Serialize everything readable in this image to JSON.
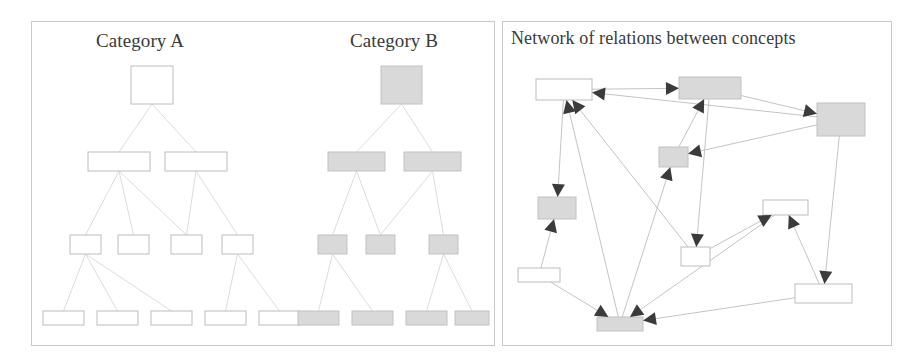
{
  "figure": {
    "background": "#ffffff",
    "panel_border_color": "#c9c9c9",
    "node_white_fill": "#ffffff",
    "node_gray_fill": "#d9d9d9",
    "node_stroke_color": "#bdbdbd",
    "edge_color": "#dcdcdc",
    "arrow_color": "#3b3b3b"
  },
  "panels": {
    "left": {
      "name": "hierarchies-panel",
      "x": 31,
      "y": 21,
      "width": 464,
      "height": 325
    },
    "right": {
      "name": "network-panel",
      "x": 502,
      "y": 21,
      "width": 390,
      "height": 325
    }
  },
  "titles": {
    "category_a": "Category A",
    "category_b": "Category B",
    "network": "Network of relations between concepts"
  },
  "tree_a": {
    "label": "Category A",
    "fill": "white",
    "nodes": [
      {
        "id": "a0",
        "level": 0,
        "x": 131,
        "y": 66,
        "w": 42,
        "h": 38
      },
      {
        "id": "a1",
        "level": 1,
        "x": 88,
        "y": 152,
        "w": 62,
        "h": 19
      },
      {
        "id": "a2",
        "level": 1,
        "x": 165,
        "y": 152,
        "w": 62,
        "h": 19
      },
      {
        "id": "a3",
        "level": 2,
        "x": 70,
        "y": 235,
        "w": 31,
        "h": 19
      },
      {
        "id": "a4",
        "level": 2,
        "x": 118,
        "y": 235,
        "w": 31,
        "h": 19
      },
      {
        "id": "a5",
        "level": 2,
        "x": 171,
        "y": 235,
        "w": 31,
        "h": 19
      },
      {
        "id": "a6",
        "level": 2,
        "x": 222,
        "y": 235,
        "w": 31,
        "h": 19
      },
      {
        "id": "a7",
        "level": 3,
        "x": 43,
        "y": 311,
        "w": 41,
        "h": 14
      },
      {
        "id": "a8",
        "level": 3,
        "x": 97,
        "y": 311,
        "w": 41,
        "h": 14
      },
      {
        "id": "a9",
        "level": 3,
        "x": 151,
        "y": 311,
        "w": 41,
        "h": 14
      },
      {
        "id": "a10",
        "level": 3,
        "x": 205,
        "y": 311,
        "w": 41,
        "h": 14
      },
      {
        "id": "a11",
        "level": 3,
        "x": 259,
        "y": 311,
        "w": 41,
        "h": 14
      }
    ],
    "edges": [
      [
        "a0",
        "a1"
      ],
      [
        "a0",
        "a2"
      ],
      [
        "a1",
        "a3"
      ],
      [
        "a1",
        "a4"
      ],
      [
        "a1",
        "a5"
      ],
      [
        "a2",
        "a5"
      ],
      [
        "a2",
        "a6"
      ],
      [
        "a3",
        "a7"
      ],
      [
        "a3",
        "a8"
      ],
      [
        "a3",
        "a9"
      ],
      [
        "a6",
        "a10"
      ],
      [
        "a6",
        "a11"
      ]
    ]
  },
  "tree_b": {
    "label": "Category B",
    "fill": "gray",
    "nodes": [
      {
        "id": "b0",
        "level": 0,
        "x": 381,
        "y": 66,
        "w": 41,
        "h": 38
      },
      {
        "id": "b1",
        "level": 1,
        "x": 328,
        "y": 152,
        "w": 57,
        "h": 19
      },
      {
        "id": "b2",
        "level": 1,
        "x": 404,
        "y": 152,
        "w": 57,
        "h": 19
      },
      {
        "id": "b3",
        "level": 2,
        "x": 318,
        "y": 235,
        "w": 29,
        "h": 19
      },
      {
        "id": "b4",
        "level": 2,
        "x": 366,
        "y": 235,
        "w": 29,
        "h": 19
      },
      {
        "id": "b5",
        "level": 2,
        "x": 429,
        "y": 235,
        "w": 29,
        "h": 19
      },
      {
        "id": "b6",
        "level": 3,
        "x": 298,
        "y": 311,
        "w": 41,
        "h": 14
      },
      {
        "id": "b7",
        "level": 3,
        "x": 352,
        "y": 311,
        "w": 41,
        "h": 14
      },
      {
        "id": "b8",
        "level": 3,
        "x": 406,
        "y": 311,
        "w": 41,
        "h": 14
      },
      {
        "id": "b9",
        "level": 3,
        "x": 455,
        "y": 311,
        "w": 34,
        "h": 14
      }
    ],
    "edges": [
      [
        "b0",
        "b1"
      ],
      [
        "b0",
        "b2"
      ],
      [
        "b1",
        "b3"
      ],
      [
        "b1",
        "b4"
      ],
      [
        "b2",
        "b4"
      ],
      [
        "b2",
        "b5"
      ],
      [
        "b3",
        "b6"
      ],
      [
        "b3",
        "b7"
      ],
      [
        "b5",
        "b8"
      ],
      [
        "b5",
        "b9"
      ]
    ]
  },
  "network": {
    "label": "Network of relations between concepts",
    "nodes": [
      {
        "id": "n1",
        "fill": "white",
        "x": 536,
        "y": 79,
        "w": 56,
        "h": 21
      },
      {
        "id": "n2",
        "fill": "gray",
        "x": 679,
        "y": 77,
        "w": 62,
        "h": 22
      },
      {
        "id": "n3",
        "fill": "gray",
        "x": 817,
        "y": 103,
        "w": 48,
        "h": 33
      },
      {
        "id": "n4",
        "fill": "gray",
        "x": 659,
        "y": 147,
        "w": 29,
        "h": 20
      },
      {
        "id": "n5",
        "fill": "gray",
        "x": 538,
        "y": 197,
        "w": 38,
        "h": 22
      },
      {
        "id": "n6",
        "fill": "white",
        "x": 681,
        "y": 247,
        "w": 29,
        "h": 19
      },
      {
        "id": "n7",
        "fill": "white",
        "x": 763,
        "y": 200,
        "w": 45,
        "h": 15
      },
      {
        "id": "n8",
        "fill": "white",
        "x": 795,
        "y": 284,
        "w": 57,
        "h": 19
      },
      {
        "id": "n9",
        "fill": "gray",
        "x": 597,
        "y": 317,
        "w": 46,
        "h": 14
      },
      {
        "id": "n10",
        "fill": "white",
        "x": 518,
        "y": 268,
        "w": 42,
        "h": 14
      }
    ],
    "edges": [
      {
        "from": "n1",
        "to": "n2",
        "arrow": "to"
      },
      {
        "from": "n1",
        "to": "n5",
        "arrow": "to"
      },
      {
        "from": "n9",
        "to": "n1",
        "arrow": "to"
      },
      {
        "from": "n6",
        "to": "n1",
        "arrow": "to"
      },
      {
        "from": "n3",
        "to": "n1",
        "arrow": "to"
      },
      {
        "from": "n2",
        "to": "n3",
        "arrow": "to"
      },
      {
        "from": "n4",
        "to": "n2",
        "arrow": "to"
      },
      {
        "from": "n2",
        "to": "n6",
        "arrow": "to"
      },
      {
        "from": "n3",
        "to": "n4",
        "arrow": "to"
      },
      {
        "from": "n3",
        "to": "n8",
        "arrow": "to"
      },
      {
        "from": "n9",
        "to": "n4",
        "arrow": "to"
      },
      {
        "from": "n10",
        "to": "n5",
        "arrow": "to"
      },
      {
        "from": "n6",
        "to": "n7",
        "arrow": "to"
      },
      {
        "from": "n8",
        "to": "n7",
        "arrow": "to"
      },
      {
        "from": "n10",
        "to": "n9",
        "arrow": "to"
      },
      {
        "from": "n8",
        "to": "n9",
        "arrow": "to"
      },
      {
        "from": "n7",
        "to": "n9",
        "arrow": "to"
      }
    ]
  }
}
